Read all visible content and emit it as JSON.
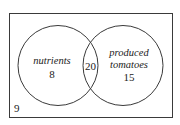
{
  "diagram": {
    "type": "venn",
    "universe": {
      "count": "9"
    },
    "sets": [
      {
        "label": "nutrients",
        "only_count": "8"
      },
      {
        "label_line1": "produced",
        "label_line2": "tomatoes",
        "only_count": "15"
      }
    ],
    "intersection": {
      "count": "20"
    },
    "colors": {
      "stroke": "#3a3a3a",
      "text": "#222222",
      "background": "#ffffff"
    }
  }
}
